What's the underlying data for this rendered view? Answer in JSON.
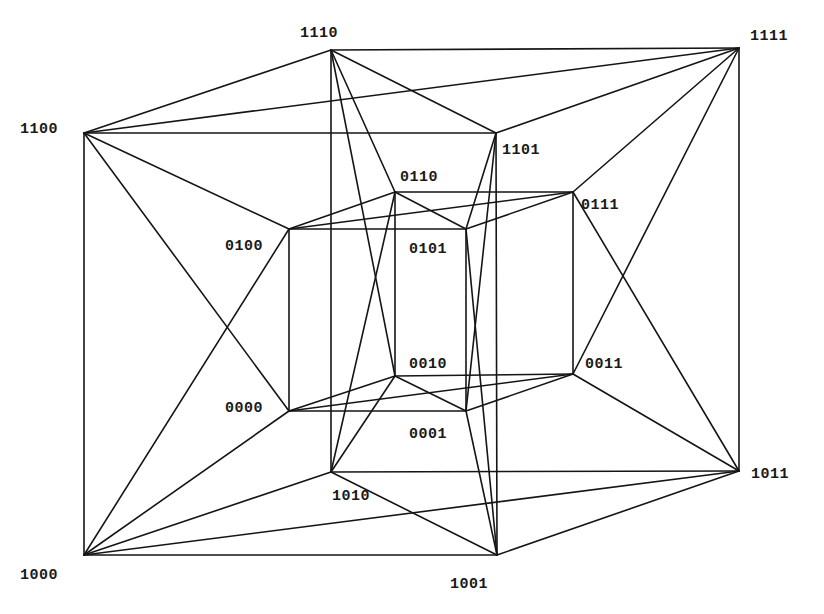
{
  "diagram": {
    "type": "augmented-4-cube-graph",
    "line_color": "#151515",
    "background": "#ffffff",
    "vertices": [
      {
        "id": "1110",
        "label": "1110",
        "x": 331,
        "y": 50,
        "lx": 300,
        "ly": 37
      },
      {
        "id": "1111",
        "label": "1111",
        "x": 739,
        "y": 48,
        "lx": 750,
        "ly": 40
      },
      {
        "id": "1100",
        "label": "1100",
        "x": 84,
        "y": 133,
        "lx": 20,
        "ly": 133
      },
      {
        "id": "1101",
        "label": "1101",
        "x": 496,
        "y": 133,
        "lx": 502,
        "ly": 154
      },
      {
        "id": "0110",
        "label": "0110",
        "x": 395,
        "y": 192,
        "lx": 400,
        "ly": 181
      },
      {
        "id": "0111",
        "label": "0111",
        "x": 573,
        "y": 192,
        "lx": 581,
        "ly": 209
      },
      {
        "id": "0100",
        "label": "0100",
        "x": 289,
        "y": 229,
        "lx": 225,
        "ly": 250
      },
      {
        "id": "0101",
        "label": "0101",
        "x": 466,
        "y": 229,
        "lx": 409,
        "ly": 253
      },
      {
        "id": "0010",
        "label": "0010",
        "x": 395,
        "y": 376,
        "lx": 409,
        "ly": 368
      },
      {
        "id": "0011",
        "label": "0011",
        "x": 573,
        "y": 374,
        "lx": 585,
        "ly": 368
      },
      {
        "id": "0000",
        "label": "0000",
        "x": 289,
        "y": 411,
        "lx": 225,
        "ly": 412
      },
      {
        "id": "0001",
        "label": "0001",
        "x": 466,
        "y": 411,
        "lx": 409,
        "ly": 438
      },
      {
        "id": "1010",
        "label": "1010",
        "x": 331,
        "y": 472,
        "lx": 332,
        "ly": 500
      },
      {
        "id": "1011",
        "label": "1011",
        "x": 739,
        "y": 471,
        "lx": 751,
        "ly": 478
      },
      {
        "id": "1000",
        "label": "1000",
        "x": 84,
        "y": 555,
        "lx": 20,
        "ly": 579
      },
      {
        "id": "1001",
        "label": "1001",
        "x": 497,
        "y": 555,
        "lx": 450,
        "ly": 588
      }
    ],
    "edges": [
      [
        "1110",
        "1111"
      ],
      [
        "1110",
        "1100"
      ],
      [
        "1110",
        "1101"
      ],
      [
        "1100",
        "1111"
      ],
      [
        "1100",
        "1101"
      ],
      [
        "1101",
        "1111"
      ],
      [
        "1010",
        "1011"
      ],
      [
        "1010",
        "1000"
      ],
      [
        "1010",
        "1001"
      ],
      [
        "1000",
        "1011"
      ],
      [
        "1000",
        "1001"
      ],
      [
        "1001",
        "1011"
      ],
      [
        "0110",
        "0111"
      ],
      [
        "0110",
        "0100"
      ],
      [
        "0110",
        "0101"
      ],
      [
        "0100",
        "0111"
      ],
      [
        "0100",
        "0101"
      ],
      [
        "0101",
        "0111"
      ],
      [
        "0010",
        "0011"
      ],
      [
        "0010",
        "0000"
      ],
      [
        "0010",
        "0001"
      ],
      [
        "0000",
        "0011"
      ],
      [
        "0000",
        "0001"
      ],
      [
        "0001",
        "0011"
      ],
      [
        "1110",
        "1010"
      ],
      [
        "1100",
        "1000"
      ],
      [
        "1111",
        "1011"
      ],
      [
        "1101",
        "1001"
      ],
      [
        "0110",
        "0010"
      ],
      [
        "0100",
        "0000"
      ],
      [
        "0111",
        "0011"
      ],
      [
        "0101",
        "0001"
      ],
      [
        "1110",
        "0110"
      ],
      [
        "1110",
        "0010"
      ],
      [
        "1010",
        "0110"
      ],
      [
        "1010",
        "0010"
      ],
      [
        "1100",
        "0100"
      ],
      [
        "1100",
        "0000"
      ],
      [
        "1000",
        "0100"
      ],
      [
        "1000",
        "0000"
      ],
      [
        "1111",
        "0111"
      ],
      [
        "1111",
        "0011"
      ],
      [
        "1011",
        "0111"
      ],
      [
        "1011",
        "0011"
      ],
      [
        "1101",
        "0101"
      ],
      [
        "1101",
        "0001"
      ],
      [
        "1001",
        "0101"
      ],
      [
        "1001",
        "0001"
      ]
    ]
  }
}
